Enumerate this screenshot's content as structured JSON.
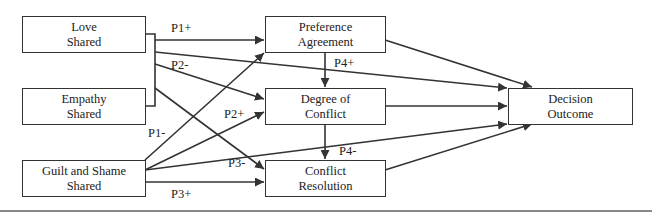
{
  "diagram": {
    "nodes": {
      "love": {
        "line1": "Love",
        "line2": "Shared"
      },
      "empathy": {
        "line1": "Empathy",
        "line2": "Shared"
      },
      "guilt": {
        "line1": "Guilt and Shame",
        "line2": "Shared"
      },
      "preference": {
        "line1": "Preference",
        "line2": "Agreement"
      },
      "degree": {
        "line1": "Degree of",
        "line2": "Conflict"
      },
      "resolution": {
        "line1": "Conflict",
        "line2": "Resolution"
      },
      "outcome": {
        "line1": "Decision",
        "line2": "Outcome"
      }
    },
    "edge_labels": {
      "p1_plus": "P1+",
      "p2_minus": "P2-",
      "p1_minus": "P1-",
      "p2_plus": "P2+",
      "p3_minus": "P3-",
      "p3_plus": "P3+",
      "p4_plus": "P4+",
      "p4_minus": "P4-"
    },
    "colors": {
      "stroke": "#333333",
      "rule": "#888888"
    }
  }
}
